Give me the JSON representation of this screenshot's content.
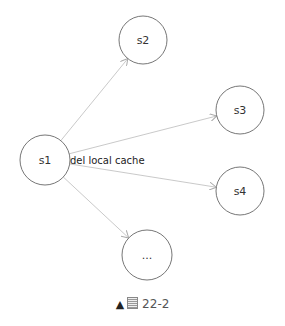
{
  "diagram": {
    "nodes": [
      {
        "id": "s1",
        "label": "s1",
        "cx": 45,
        "cy": 160,
        "r": 25
      },
      {
        "id": "s2",
        "label": "s2",
        "cx": 143,
        "cy": 40,
        "r": 24
      },
      {
        "id": "s3",
        "label": "s3",
        "cx": 240,
        "cy": 110,
        "r": 24
      },
      {
        "id": "s4",
        "label": "s4",
        "cx": 240,
        "cy": 191,
        "r": 24
      },
      {
        "id": "more",
        "label": "...",
        "cx": 147,
        "cy": 255,
        "r": 25
      }
    ],
    "edges": [
      {
        "from": "s1",
        "to": "s2"
      },
      {
        "from": "s1",
        "to": "s3"
      },
      {
        "from": "s1",
        "to": "s4"
      },
      {
        "from": "s1",
        "to": "more"
      }
    ],
    "edge_label": "del local cache",
    "colors": {
      "node_stroke": "#666666",
      "edge_stroke": "#bbbbbb",
      "text": "#333333"
    }
  },
  "caption": {
    "marker": "▲",
    "text": "22-2"
  }
}
